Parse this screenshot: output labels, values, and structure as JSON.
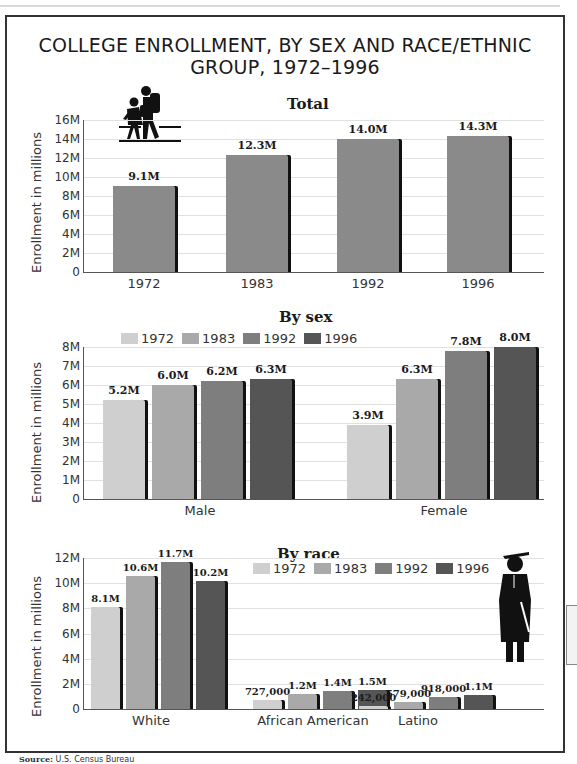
{
  "title_line1": "COLLEGE ENROLLMENT, BY SEX AND RACE/ETHNIC",
  "title_line2": "GROUP, 1972–1996",
  "source_label": "Source:",
  "source_text": "U.S. Census Bureau",
  "colors": {
    "1972": "#cfcfcf",
    "1983": "#a9a9a9",
    "1992": "#7e7e7e",
    "1996": "#555555",
    "total": "#8a8a8a"
  },
  "icons": {
    "top": "students-walking-icon",
    "bottom": "graduate-icon"
  },
  "chart_data": [
    {
      "type": "bar",
      "title": "Total",
      "ylabel": "Enrollment in millions",
      "xlabel": "",
      "ylim": [
        0,
        16
      ],
      "yticks": [
        "0",
        "2M",
        "4M",
        "6M",
        "8M",
        "10M",
        "12M",
        "14M",
        "16M"
      ],
      "categories": [
        "1972",
        "1983",
        "1992",
        "1996"
      ],
      "values": [
        9.1,
        12.3,
        14.0,
        14.3
      ],
      "labels": [
        "9.1M",
        "12.3M",
        "14.0M",
        "14.3M"
      ],
      "grid": true
    },
    {
      "type": "bar",
      "title": "By sex",
      "ylabel": "Enrollment in millions",
      "ylim": [
        0,
        8
      ],
      "yticks": [
        "0",
        "1M",
        "2M",
        "3M",
        "4M",
        "5M",
        "6M",
        "7M",
        "8M"
      ],
      "categories": [
        "Male",
        "Female"
      ],
      "legend": [
        "1972",
        "1983",
        "1992",
        "1996"
      ],
      "legend_position": "top",
      "series": [
        {
          "name": "1972",
          "values": [
            5.2,
            3.9
          ],
          "labels": [
            "5.2M",
            "3.9M"
          ]
        },
        {
          "name": "1983",
          "values": [
            6.0,
            6.3
          ],
          "labels": [
            "6.0M",
            "6.3M"
          ]
        },
        {
          "name": "1992",
          "values": [
            6.2,
            7.8
          ],
          "labels": [
            "6.2M",
            "7.8M"
          ]
        },
        {
          "name": "1996",
          "values": [
            6.3,
            8.0
          ],
          "labels": [
            "6.3M",
            "8.0M"
          ]
        }
      ],
      "grid": true
    },
    {
      "type": "bar",
      "title": "By race",
      "ylabel": "Enrollment in millions",
      "ylim": [
        0,
        12
      ],
      "yticks": [
        "0",
        "2M",
        "4M",
        "6M",
        "8M",
        "10M",
        "12M"
      ],
      "categories": [
        "White",
        "African American",
        "Latino"
      ],
      "legend": [
        "1972",
        "1983",
        "1992",
        "1996"
      ],
      "legend_position": "top-right",
      "series": [
        {
          "name": "1972",
          "values": [
            8.1,
            0.727,
            0.242
          ],
          "labels": [
            "8.1M",
            "727,000",
            "242,000"
          ]
        },
        {
          "name": "1983",
          "values": [
            10.6,
            1.2,
            0.579
          ],
          "labels": [
            "10.6M",
            "1.2M",
            "579,000"
          ]
        },
        {
          "name": "1992",
          "values": [
            11.7,
            1.4,
            0.918
          ],
          "labels": [
            "11.7M",
            "1.4M",
            "918,000"
          ]
        },
        {
          "name": "1996",
          "values": [
            10.2,
            1.5,
            1.1
          ],
          "labels": [
            "10.2M",
            "1.5M",
            "1.1M"
          ]
        }
      ],
      "grid": true
    }
  ]
}
